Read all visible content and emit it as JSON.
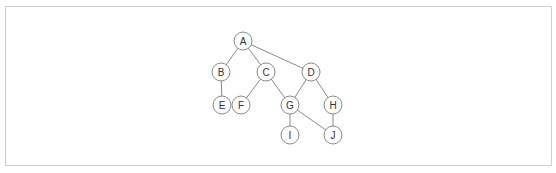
{
  "diagram": {
    "type": "graph",
    "node_radius": 9,
    "nodes": [
      {
        "id": "A",
        "label": "A",
        "x": 243,
        "y": 41
      },
      {
        "id": "B",
        "label": "B",
        "x": 221,
        "y": 72
      },
      {
        "id": "C",
        "label": "C",
        "x": 266,
        "y": 72
      },
      {
        "id": "D",
        "label": "D",
        "x": 311,
        "y": 72
      },
      {
        "id": "E",
        "label": "E",
        "x": 222,
        "y": 105
      },
      {
        "id": "F",
        "label": "F",
        "x": 241,
        "y": 105
      },
      {
        "id": "G",
        "label": "G",
        "x": 290,
        "y": 105
      },
      {
        "id": "H",
        "label": "H",
        "x": 333,
        "y": 105
      },
      {
        "id": "I",
        "label": "I",
        "x": 290,
        "y": 135
      },
      {
        "id": "J",
        "label": "J",
        "x": 333,
        "y": 135
      }
    ],
    "edges": [
      [
        "A",
        "B"
      ],
      [
        "A",
        "C"
      ],
      [
        "A",
        "D"
      ],
      [
        "B",
        "E"
      ],
      [
        "C",
        "F"
      ],
      [
        "C",
        "G"
      ],
      [
        "D",
        "G"
      ],
      [
        "D",
        "H"
      ],
      [
        "G",
        "I"
      ],
      [
        "G",
        "J"
      ],
      [
        "H",
        "J"
      ]
    ],
    "colors": {
      "stroke": "#8a8a8a",
      "text": "#333333",
      "border": "#cfcfcf"
    }
  }
}
